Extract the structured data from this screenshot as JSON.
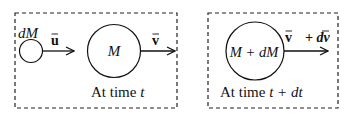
{
  "diagram": {
    "left_panel": {
      "small_mass_label": "dM",
      "small_velocity_label": "u",
      "main_mass_label": "M",
      "main_velocity_label": "v",
      "caption_prefix": "At time ",
      "caption_var": "t"
    },
    "right_panel": {
      "mass_label": "M + dM",
      "velocity_label": "v",
      "velocity_increment_label": "+ dv",
      "caption_prefix": "At time ",
      "caption_var": "t + dt"
    },
    "colors": {
      "stroke": "#111111",
      "background": "#ffffff"
    }
  }
}
